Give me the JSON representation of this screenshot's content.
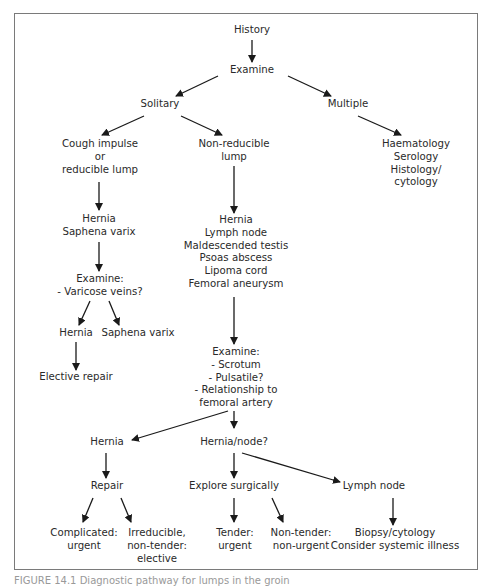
{
  "diagram": {
    "type": "flowchart",
    "nodes": {
      "history": "History",
      "examine": "Examine",
      "solitary": "Solitary",
      "multiple": "Multiple",
      "cough": [
        "Cough impulse",
        "or",
        "reducible lump"
      ],
      "nonreducible": [
        "Non-reducible",
        "lump"
      ],
      "multiple_tests": [
        "Haematology",
        "Serology",
        "Histology/",
        "cytology"
      ],
      "hernia_saphena": [
        "Hernia",
        "Saphena varix"
      ],
      "differential": [
        "Hernia",
        "Lymph node",
        "Maldescended testis",
        "Psoas abscess",
        "Lipoma cord",
        "Femoral aneurysm"
      ],
      "examine_varicose": [
        "Examine:",
        "- Varicose veins?"
      ],
      "hernia_left": "Hernia",
      "saphena_varix": "Saphena varix",
      "elective_repair": "Elective repair",
      "examine_scrotum": [
        "Examine:",
        "- Scrotum",
        "- Pulsatile?",
        "- Relationship to",
        "femoral artery"
      ],
      "hernia_mid": "Hernia",
      "hernia_node": "Hernia/node?",
      "repair": "Repair",
      "explore": "Explore surgically",
      "lymph_node": "Lymph node",
      "complicated": [
        "Complicated:",
        "urgent"
      ],
      "irreducible": [
        "Irreducible,",
        "non-tender:",
        "elective"
      ],
      "tender": [
        "Tender:",
        "urgent"
      ],
      "nontender": [
        "Non-tender:",
        "non-urgent"
      ],
      "biopsy": [
        "Biopsy/cytology",
        "Consider systemic illness"
      ]
    },
    "edges": [
      [
        "history",
        "examine"
      ],
      [
        "examine",
        "solitary"
      ],
      [
        "examine",
        "multiple"
      ],
      [
        "solitary",
        "cough"
      ],
      [
        "solitary",
        "nonreducible"
      ],
      [
        "multiple",
        "multiple_tests"
      ],
      [
        "cough",
        "hernia_saphena"
      ],
      [
        "nonreducible",
        "differential"
      ],
      [
        "hernia_saphena",
        "examine_varicose"
      ],
      [
        "examine_varicose",
        "hernia_left"
      ],
      [
        "examine_varicose",
        "saphena_varix"
      ],
      [
        "hernia_left",
        "elective_repair"
      ],
      [
        "differential",
        "examine_scrotum"
      ],
      [
        "examine_scrotum",
        "hernia_mid"
      ],
      [
        "examine_scrotum",
        "hernia_node"
      ],
      [
        "hernia_mid",
        "repair"
      ],
      [
        "hernia_node",
        "explore"
      ],
      [
        "hernia_node",
        "lymph_node"
      ],
      [
        "repair",
        "complicated"
      ],
      [
        "repair",
        "irreducible"
      ],
      [
        "explore",
        "tender"
      ],
      [
        "explore",
        "nontender"
      ],
      [
        "lymph_node",
        "biopsy"
      ]
    ],
    "caption": "FIGURE 14.1 Diagnostic pathway for lumps in the groin"
  }
}
